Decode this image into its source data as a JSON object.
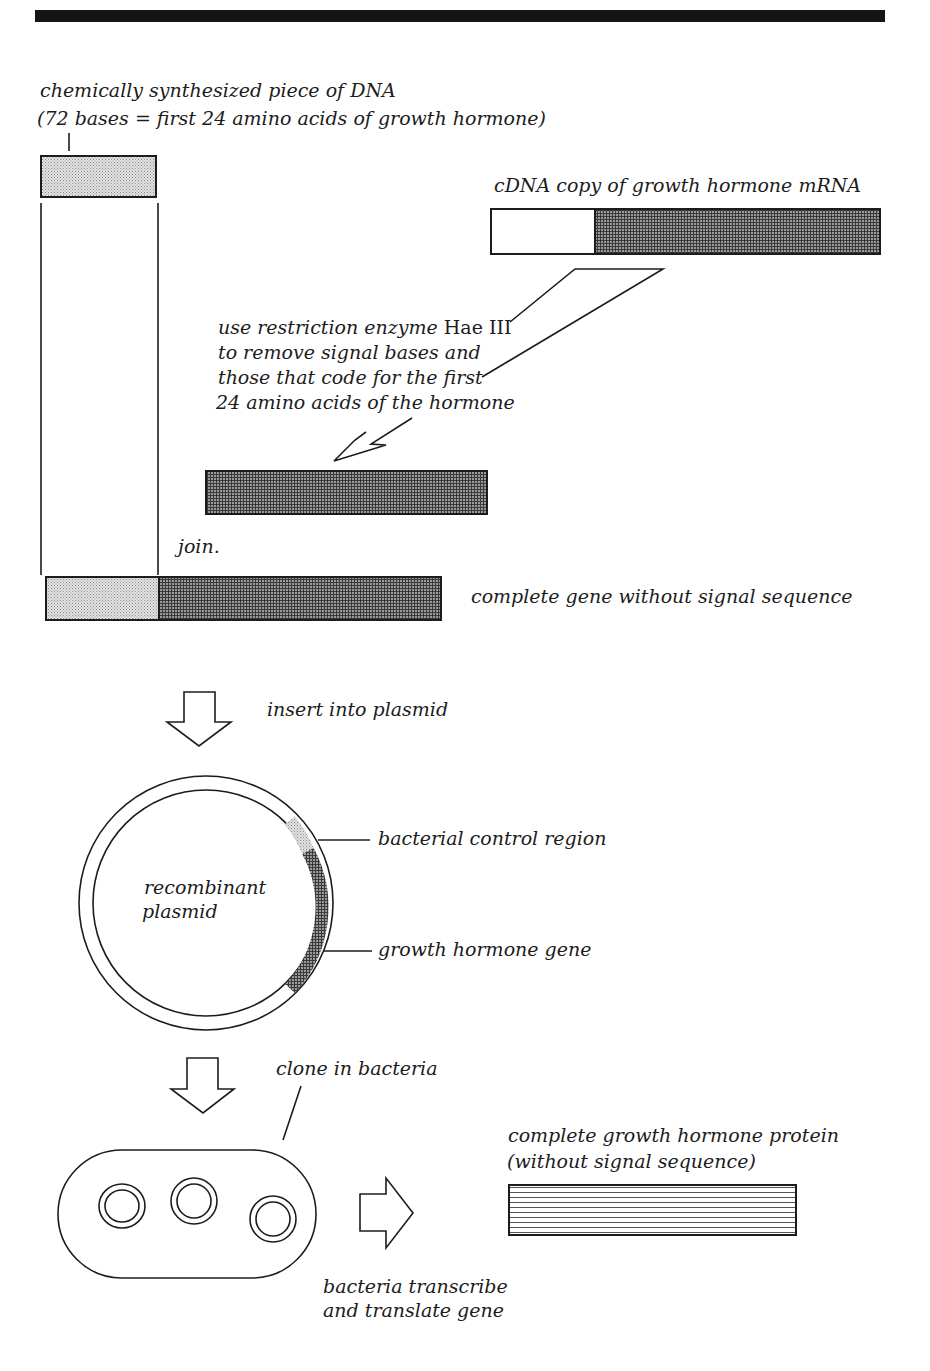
{
  "diagram": {
    "colors": {
      "ink": "#1c1c1c",
      "light_stipple": "#d9d9d9",
      "dark_crosshatch": "#6e6e6e",
      "background": "#ffffff"
    },
    "labels": {
      "synth_dna_line1": "chemically synthesized piece of DNA",
      "synth_dna_line2": "(72 bases = first 24 amino acids of growth hormone)",
      "cdna": "cDNA copy of growth hormone mRNA",
      "enzyme_line1_a": "use restriction enzyme ",
      "enzyme_line1_b": "Hae III",
      "enzyme_line2": "to remove  signal bases and",
      "enzyme_line3": "those that code for the first",
      "enzyme_line4": "24 amino acids of the hormone",
      "join": "join.",
      "complete_gene": "complete gene without signal sequence",
      "insert": "insert into plasmid",
      "plasmid_line1": "recombinant",
      "plasmid_line2": "plasmid",
      "control_region": "bacterial control region",
      "hormone_gene": "growth hormone gene",
      "clone": "clone in bacteria",
      "protein_line1": "complete growth hormone protein",
      "protein_line2": "(without signal sequence)",
      "transcribe_line1": "bacteria transcribe",
      "transcribe_line2": "and translate gene"
    },
    "steps": [
      "chemically synthesized DNA (72 bases)",
      "cDNA copy of growth hormone mRNA",
      "cut with Hae III",
      "join",
      "complete gene without signal sequence",
      "insert into plasmid",
      "recombinant plasmid",
      "clone in bacteria",
      "bacteria transcribe and translate gene",
      "complete growth hormone protein"
    ]
  }
}
